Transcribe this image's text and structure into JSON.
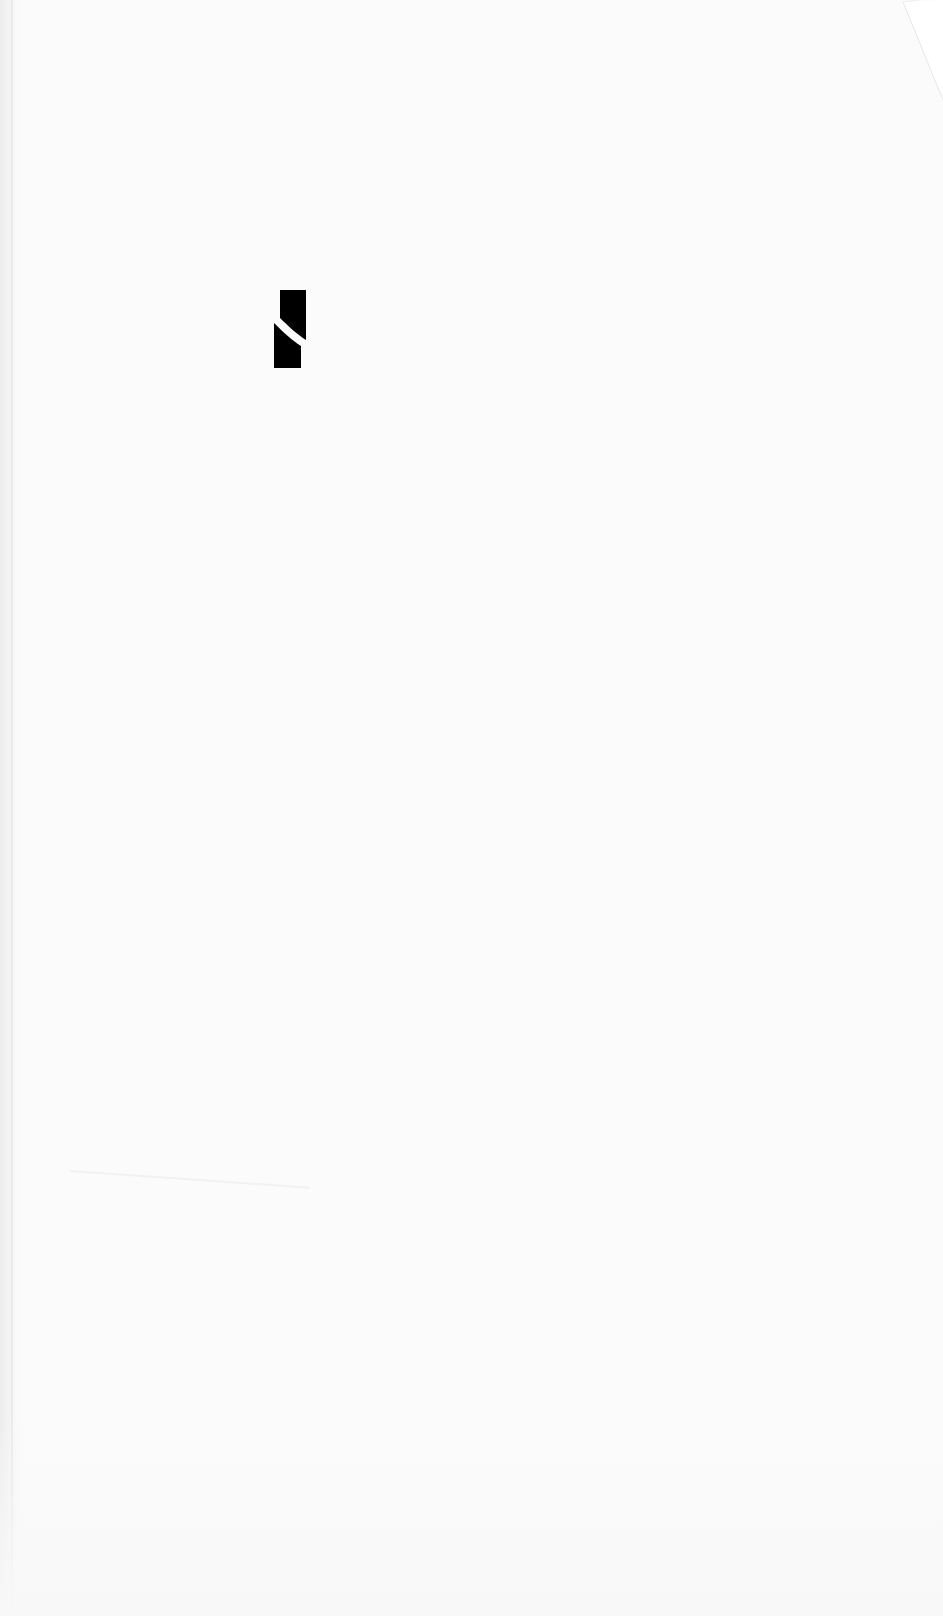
{
  "document": {
    "type": "blank scanned page",
    "background_color": "#fbfbfb",
    "logo": {
      "icon": "split-bar-logo-icon",
      "color": "#000000"
    },
    "corner": {
      "icon": "folded-corner-icon"
    }
  }
}
